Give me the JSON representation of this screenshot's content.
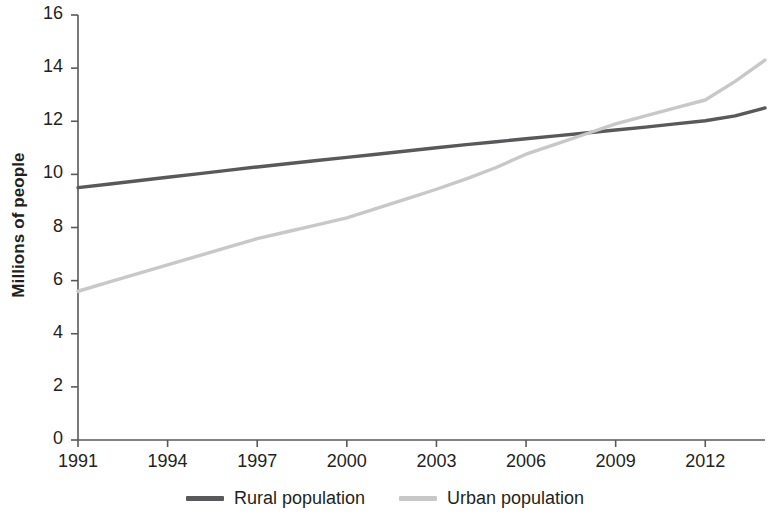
{
  "chart_data": {
    "type": "line",
    "title": "",
    "subtitle": "",
    "xlabel": "",
    "ylabel": "Millions of people",
    "xlim": [
      1991,
      2014
    ],
    "ylim": [
      0,
      16
    ],
    "grid": false,
    "legend_position": "bottom-center",
    "x_ticks": [
      "1991",
      "1994",
      "1997",
      "2000",
      "2003",
      "2006",
      "2009",
      "2012"
    ],
    "y_ticks": [
      "0",
      "2",
      "4",
      "6",
      "8",
      "10",
      "12",
      "14",
      "16"
    ],
    "x": [
      1991,
      1992,
      1993,
      1994,
      1995,
      1996,
      1997,
      1998,
      1999,
      2000,
      2001,
      2002,
      2003,
      2004,
      2005,
      2006,
      2007,
      2008,
      2009,
      2010,
      2011,
      2012,
      2013,
      2014
    ],
    "series": [
      {
        "name": "Rural population",
        "color": "#59595b",
        "values": [
          9.5,
          9.63,
          9.76,
          9.89,
          10.02,
          10.15,
          10.28,
          10.4,
          10.52,
          10.64,
          10.76,
          10.88,
          11.0,
          11.12,
          11.23,
          11.34,
          11.45,
          11.56,
          11.67,
          11.78,
          11.9,
          12.02,
          12.2,
          12.5
        ]
      },
      {
        "name": "Urban population",
        "color": "#c8c8c8",
        "values": [
          5.6,
          5.93,
          6.26,
          6.59,
          6.92,
          7.25,
          7.58,
          7.84,
          8.1,
          8.36,
          8.72,
          9.08,
          9.44,
          9.83,
          10.26,
          10.76,
          11.14,
          11.52,
          11.9,
          12.2,
          12.5,
          12.8,
          13.5,
          14.3
        ]
      }
    ]
  },
  "legend": {
    "entries": [
      {
        "label": "Rural population",
        "color": "#59595b"
      },
      {
        "label": "Urban population",
        "color": "#c8c8c8"
      }
    ]
  },
  "colors": {
    "rural": "#59595b",
    "urban": "#c8c8c8",
    "axis": "#58595b",
    "text": "#231f20",
    "background": "#ffffff"
  }
}
